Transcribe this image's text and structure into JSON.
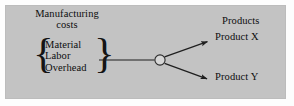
{
  "diagram": {
    "panel_color": "#c3c3c3",
    "ink_color": "#0d0d0d",
    "left_group": {
      "heading": "Manufacturing\ncosts",
      "heading_line_1": "Manufacturing",
      "heading_line_2": "costs",
      "brace_left": "{",
      "brace_right": "}",
      "items": [
        {
          "label": "Material"
        },
        {
          "label": "Labor"
        },
        {
          "label": "Overhead"
        }
      ]
    },
    "junction": {
      "shape": "open-circle",
      "fill": "#d4d4d4",
      "stroke": "#2b2b2b",
      "cx": 160,
      "cy": 60,
      "r": 5.2
    },
    "connectors": [
      {
        "name": "brace-to-junction",
        "from_x": 99,
        "from_y": 60,
        "to_x": 154.8,
        "to_y": 60,
        "arrow": false
      },
      {
        "name": "junction-to-product-x",
        "from_x": 164.4,
        "from_y": 56.6,
        "to_x": 210,
        "to_y": 40.5,
        "arrow": true
      },
      {
        "name": "junction-to-product-y",
        "from_x": 164.4,
        "from_y": 63.4,
        "to_x": 210,
        "to_y": 80,
        "arrow": true
      }
    ],
    "right_group": {
      "heading": "Products",
      "outputs": [
        {
          "label": "Product X"
        },
        {
          "label": "Product Y"
        }
      ]
    }
  }
}
